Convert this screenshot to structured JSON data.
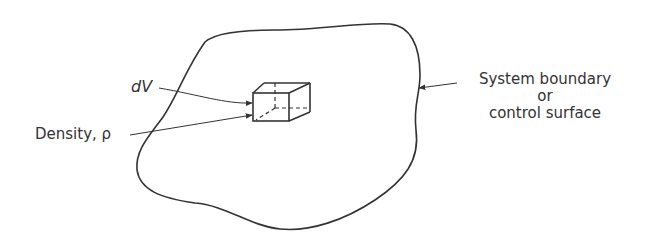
{
  "figure": {
    "labels": {
      "volume_element": "dV",
      "density": "Density, ρ",
      "boundary_line1": "System boundary",
      "boundary_line2": "or",
      "boundary_line3": "control surface"
    },
    "colors": {
      "stroke": "#333333",
      "background": "#ffffff"
    }
  }
}
